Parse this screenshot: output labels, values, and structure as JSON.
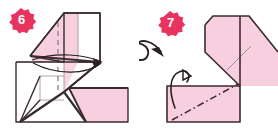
{
  "figure": {
    "kind": "origami-instruction-diagram",
    "panel_count": 2,
    "background_color": "#ffffff",
    "paper_front_color": "#f7cfdf",
    "paper_edge_color": "#3a2b30",
    "crease_color": "#9b8d92",
    "badge_color": "#e8335e",
    "badge_text_color": "#ffffff"
  },
  "panels": [
    {
      "id": "step-6",
      "badge_label": "6",
      "badge_name": "step-number-badge-6",
      "description": "Folded paper model with vertical valley crease and two sweeping arrows to the right",
      "arrows": [
        {
          "name": "fold-arrow-upper",
          "type": "thin-sweep",
          "direction": "right"
        },
        {
          "name": "fold-arrow-lower",
          "type": "thin-sweep",
          "direction": "right"
        }
      ],
      "creases": [
        {
          "name": "vertical-valley-crease",
          "style": "dashed",
          "color": "#9b8d92"
        }
      ]
    },
    {
      "id": "step-7",
      "badge_label": "7",
      "badge_name": "step-number-badge-7",
      "description": "Flipped model, a diagonal pink band over a rectangle with a dash-dot mountain crease",
      "arrows": [
        {
          "name": "turn-over-arrow",
          "type": "loop-flip",
          "direction": "clockwise"
        },
        {
          "name": "small-fold-arrow",
          "type": "hook",
          "direction": "up-left"
        }
      ],
      "creases": [
        {
          "name": "dash-dot-mountain-crease",
          "style": "dash-dot",
          "color": "#3a2b30"
        },
        {
          "name": "band-interior-crease",
          "style": "solid-light",
          "color": "#9b8d92"
        }
      ]
    }
  ]
}
